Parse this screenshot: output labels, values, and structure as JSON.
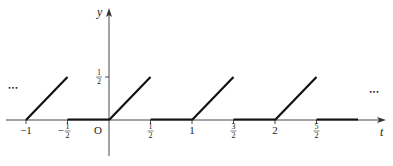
{
  "chart_data": {
    "type": "line",
    "title": "",
    "xlabel": "t",
    "ylabel": "y",
    "origin_label": "O",
    "xlim": [
      -1.25,
      3.35
    ],
    "ylim": [
      -0.42,
      1.28
    ],
    "grid": false,
    "x_ticks": [
      {
        "value": -1,
        "label": "−1",
        "fraction": false
      },
      {
        "value": -0.5,
        "label": "−",
        "num": "1",
        "den": "2",
        "fraction": true
      },
      {
        "value": 0.5,
        "label": "",
        "num": "1",
        "den": "2",
        "fraction": true
      },
      {
        "value": 1,
        "label": "1",
        "fraction": false
      },
      {
        "value": 1.5,
        "label": "",
        "num": "3",
        "den": "2",
        "fraction": true
      },
      {
        "value": 2,
        "label": "2",
        "fraction": false
      },
      {
        "value": 2.5,
        "label": "",
        "num": "5",
        "den": "2",
        "fraction": true
      }
    ],
    "y_ticks": [
      {
        "value": 0.5,
        "num": "1",
        "den": "2"
      }
    ],
    "series": [
      {
        "name": "f(t)",
        "segments": [
          {
            "x": [
              -1,
              -0.5
            ],
            "y": [
              0,
              0.5
            ]
          },
          {
            "x": [
              -0.5,
              0
            ],
            "y": [
              0,
              0
            ]
          },
          {
            "x": [
              0,
              0.5
            ],
            "y": [
              0,
              0.5
            ]
          },
          {
            "x": [
              0.5,
              1
            ],
            "y": [
              0,
              0
            ]
          },
          {
            "x": [
              1,
              1.5
            ],
            "y": [
              0,
              0.5
            ]
          },
          {
            "x": [
              1.5,
              2
            ],
            "y": [
              0,
              0
            ]
          },
          {
            "x": [
              2,
              2.5
            ],
            "y": [
              0,
              0.5
            ]
          },
          {
            "x": [
              2.5,
              3
            ],
            "y": [
              0,
              0
            ]
          }
        ]
      }
    ],
    "annotations": [
      {
        "text": "…",
        "x": -1.15,
        "y": 0.35,
        "meaning": "continues-left"
      },
      {
        "text": "…",
        "x": 3.2,
        "y": 0.3,
        "meaning": "continues-right"
      }
    ],
    "legend": "none"
  }
}
